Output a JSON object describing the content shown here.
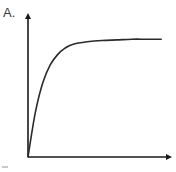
{
  "panel": {
    "label": "A."
  },
  "colors": {
    "axis": "#1a1a1a",
    "curve": "#2a2a2a",
    "background": "#ffffff"
  },
  "chart_data": {
    "type": "line",
    "title": "A.",
    "xlabel": "",
    "ylabel": "",
    "grid": false,
    "legend": null,
    "xlim": [
      0,
      1
    ],
    "ylim": [
      0,
      1
    ],
    "ticks": {
      "x": [],
      "y": []
    },
    "series": [
      {
        "name": "curve",
        "x": [
          0.0,
          0.05,
          0.1,
          0.15,
          0.2,
          0.25,
          0.3,
          0.4,
          0.5,
          0.6,
          0.7,
          0.8,
          0.9
        ],
        "y": [
          0.0,
          0.35,
          0.58,
          0.72,
          0.8,
          0.85,
          0.88,
          0.9,
          0.91,
          0.915,
          0.92,
          0.92,
          0.92
        ]
      }
    ]
  }
}
